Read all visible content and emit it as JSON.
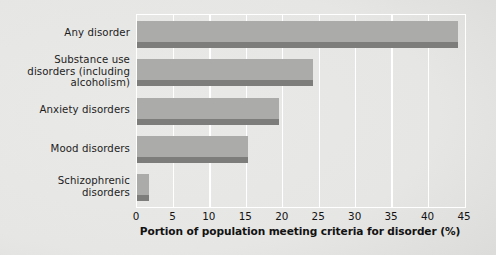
{
  "chart_data": {
    "type": "bar",
    "orientation": "horizontal",
    "title": "",
    "xlabel": "Portion of population meeting criteria for disorder (%)",
    "ylabel": "",
    "xlim": [
      0,
      45
    ],
    "xticks": [
      "0",
      "5",
      "10",
      "15",
      "20",
      "25",
      "30",
      "35",
      "40",
      "45"
    ],
    "xtick_values": [
      0,
      5,
      10,
      15,
      20,
      25,
      30,
      35,
      40,
      45
    ],
    "grid": "vertical-white",
    "legend": "none",
    "categories": [
      "Any disorder",
      "Substance use disorders (including alcoholism)",
      "Anxiety disorders",
      "Mood disorders",
      "Schizophrenic disorders"
    ],
    "category_lines": [
      [
        "Any disorder"
      ],
      [
        "Substance use",
        "disorders (including",
        "alcoholism)"
      ],
      [
        "Anxiety disorders"
      ],
      [
        "Mood disorders"
      ],
      [
        "Schizophrenic",
        "disorders"
      ]
    ],
    "values": [
      44,
      24.1,
      19.5,
      15.2,
      1.6
    ],
    "bar_color": "#ababa9",
    "bar_shadow_color": "#7d7d7b",
    "gridline_color": "#ffffff",
    "background_color": "#e6e6e4"
  }
}
